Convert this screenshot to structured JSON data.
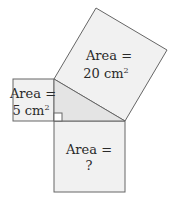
{
  "diagram": {
    "type": "pythagorean-squares",
    "colors": {
      "square_fill": "#f1f1f1",
      "triangle_fill": "#e4e4e4",
      "stroke": "#666666",
      "text": "#2a2a2a"
    },
    "large_square": {
      "line1": "Area =",
      "value": "20 cm",
      "unit_exp": "2"
    },
    "small_square": {
      "line1": "Area =",
      "value": "5 cm",
      "unit_exp": "2"
    },
    "bottom_square": {
      "line1": "Area =",
      "line2": "?"
    }
  }
}
